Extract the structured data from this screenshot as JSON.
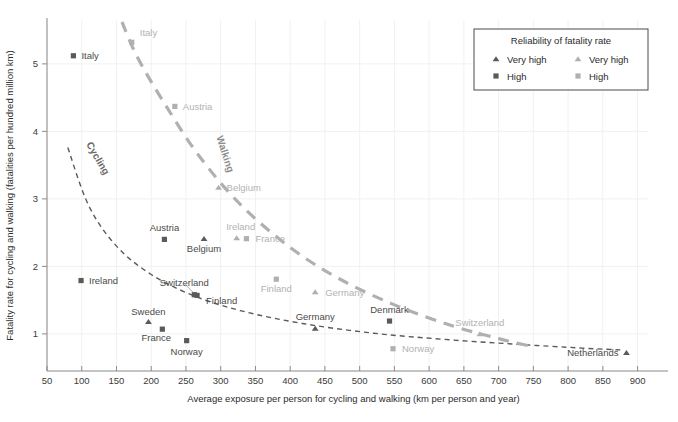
{
  "chart_data": {
    "type": "scatter",
    "title": "",
    "xlabel": "Average exposure per person for cycling and walking (km per person and year)",
    "ylabel": "Fatality rate for cycling and walking (fatalities per hundred million km)",
    "xlim": [
      50,
      915
    ],
    "ylim": [
      0.45,
      5.65
    ],
    "xticks": [
      50,
      100,
      150,
      200,
      250,
      300,
      350,
      400,
      450,
      500,
      550,
      600,
      650,
      700,
      750,
      800,
      850,
      900
    ],
    "yticks": [
      1,
      2,
      3,
      4,
      5
    ],
    "grid": true,
    "legend": {
      "title": "Reliability of fatality rate",
      "position": "top-right",
      "columns": [
        {
          "series": "Cycling",
          "color": "#5a5a5a",
          "items": [
            {
              "marker": "triangle",
              "label": "Very high"
            },
            {
              "marker": "square",
              "label": "High"
            }
          ]
        },
        {
          "series": "Walking",
          "color": "#b0b0b0",
          "items": [
            {
              "marker": "triangle",
              "label": "Very high"
            },
            {
              "marker": "square",
              "label": "High"
            }
          ]
        }
      ]
    },
    "series": [
      {
        "name": "Cycling",
        "color": "#5a5a5a",
        "trend_label": "Cycling",
        "points": [
          {
            "country": "Italy",
            "x": 88,
            "y": 5.12,
            "marker": "square",
            "reliability": "High",
            "label_dx": 8,
            "label_dy": 3.5,
            "anchor": "start"
          },
          {
            "country": "Ireland",
            "x": 99,
            "y": 1.79,
            "marker": "square",
            "reliability": "High",
            "label_dx": 8,
            "label_dy": 3.5,
            "anchor": "start"
          },
          {
            "country": "Sweden",
            "x": 196,
            "y": 1.18,
            "marker": "triangle",
            "reliability": "Very high",
            "label_dx": 0,
            "label_dy": -7,
            "anchor": "middle"
          },
          {
            "country": "France",
            "x": 216,
            "y": 1.07,
            "marker": "square",
            "reliability": "High",
            "label_dx": -6,
            "label_dy": 12,
            "anchor": "middle"
          },
          {
            "country": "Austria",
            "x": 219,
            "y": 2.4,
            "marker": "square",
            "reliability": "High",
            "label_dx": 0,
            "label_dy": -8,
            "anchor": "middle"
          },
          {
            "country": "Norway",
            "x": 251,
            "y": 0.9,
            "marker": "square",
            "reliability": "High",
            "label_dx": 0,
            "label_dy": 14,
            "anchor": "middle"
          },
          {
            "country": "Switzerland",
            "x": 262,
            "y": 1.58,
            "marker": "square",
            "reliability": "High",
            "label_dx": -10,
            "label_dy": -9,
            "anchor": "middle"
          },
          {
            "country": "Finland",
            "x": 266,
            "y": 1.57,
            "marker": "square",
            "reliability": "High",
            "label_dx": 9,
            "label_dy": 9,
            "anchor": "start"
          },
          {
            "country": "Belgium",
            "x": 276,
            "y": 2.41,
            "marker": "triangle",
            "reliability": "Very high",
            "label_dx": 0,
            "label_dy": 13,
            "anchor": "middle"
          },
          {
            "country": "Germany",
            "x": 436,
            "y": 1.08,
            "marker": "triangle",
            "reliability": "Very high",
            "label_dx": 0,
            "label_dy": -8,
            "anchor": "middle"
          },
          {
            "country": "Denmark",
            "x": 543,
            "y": 1.19,
            "marker": "square",
            "reliability": "High",
            "label_dx": 0,
            "label_dy": -8,
            "anchor": "middle"
          },
          {
            "country": "Netherlands",
            "x": 884,
            "y": 0.72,
            "marker": "triangle",
            "reliability": "Very high",
            "label_dx": -8,
            "label_dy": 3.5,
            "anchor": "end"
          }
        ],
        "trend": [
          {
            "x": 80,
            "y": 3.76
          },
          {
            "x": 110,
            "y": 2.9
          },
          {
            "x": 150,
            "y": 2.3
          },
          {
            "x": 200,
            "y": 1.88
          },
          {
            "x": 260,
            "y": 1.57
          },
          {
            "x": 330,
            "y": 1.34
          },
          {
            "x": 420,
            "y": 1.15
          },
          {
            "x": 520,
            "y": 1.01
          },
          {
            "x": 620,
            "y": 0.92
          },
          {
            "x": 720,
            "y": 0.85
          },
          {
            "x": 820,
            "y": 0.79
          },
          {
            "x": 880,
            "y": 0.76
          }
        ]
      },
      {
        "name": "Walking",
        "color": "#b0b0b0",
        "trend_label": "Walking",
        "points": [
          {
            "country": "Italy",
            "x": 172,
            "y": 5.32,
            "marker": "square",
            "reliability": "High",
            "label_dx": 8,
            "label_dy": -6,
            "anchor": "start"
          },
          {
            "country": "Austria",
            "x": 234,
            "y": 4.37,
            "marker": "square",
            "reliability": "High",
            "label_dx": 8,
            "label_dy": 3.5,
            "anchor": "start"
          },
          {
            "country": "Belgium",
            "x": 297,
            "y": 3.17,
            "marker": "triangle",
            "reliability": "Very high",
            "label_dx": 8,
            "label_dy": 3.5,
            "anchor": "start"
          },
          {
            "country": "Ireland",
            "x": 323,
            "y": 2.42,
            "marker": "triangle",
            "reliability": "Very high",
            "label_dx": 4,
            "label_dy": -8,
            "anchor": "middle"
          },
          {
            "country": "France",
            "x": 337,
            "y": 2.41,
            "marker": "square",
            "reliability": "High",
            "label_dx": 9,
            "label_dy": 3.5,
            "anchor": "start"
          },
          {
            "country": "Finland",
            "x": 380,
            "y": 1.81,
            "marker": "square",
            "reliability": "High",
            "label_dx": 0,
            "label_dy": 13,
            "anchor": "middle"
          },
          {
            "country": "Germany",
            "x": 436,
            "y": 1.62,
            "marker": "triangle",
            "reliability": "Very high",
            "label_dx": 10,
            "label_dy": 3.5,
            "anchor": "start"
          },
          {
            "country": "Norway",
            "x": 548,
            "y": 0.78,
            "marker": "square",
            "reliability": "High",
            "label_dx": 9,
            "label_dy": 3.5,
            "anchor": "start"
          },
          {
            "country": "Switzerland",
            "x": 673,
            "y": 1.0,
            "marker": "triangle",
            "reliability": "Very high",
            "label_dx": 0,
            "label_dy": -8,
            "anchor": "middle"
          }
        ],
        "trend": [
          {
            "x": 158,
            "y": 5.62
          },
          {
            "x": 180,
            "y": 5.1
          },
          {
            "x": 220,
            "y": 4.4
          },
          {
            "x": 270,
            "y": 3.62
          },
          {
            "x": 330,
            "y": 2.9
          },
          {
            "x": 400,
            "y": 2.28
          },
          {
            "x": 470,
            "y": 1.82
          },
          {
            "x": 550,
            "y": 1.43
          },
          {
            "x": 630,
            "y": 1.13
          },
          {
            "x": 700,
            "y": 0.93
          },
          {
            "x": 745,
            "y": 0.82
          }
        ]
      }
    ]
  },
  "figure": {
    "caption": ""
  }
}
